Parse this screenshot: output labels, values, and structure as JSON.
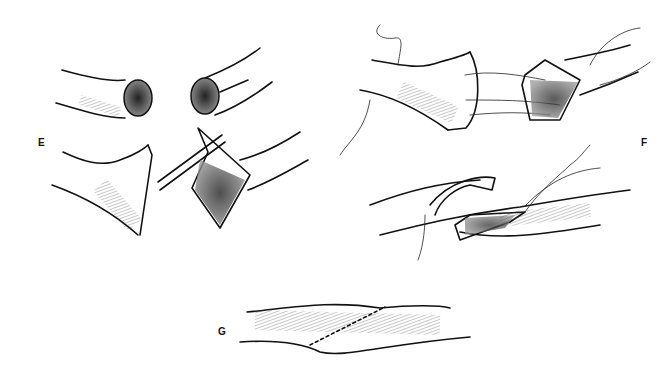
{
  "figure": {
    "panels": [
      {
        "label": "E",
        "description": "Vessel ends opened and spatulated for anastomosis"
      },
      {
        "label": "F",
        "description": "Corner stay sutures placed and vessel ends approximated"
      },
      {
        "label": "G",
        "description": "Completed anastomosis with interrupted suture line"
      }
    ],
    "colors": {
      "ink": "#111111",
      "background": "#ffffff"
    }
  }
}
